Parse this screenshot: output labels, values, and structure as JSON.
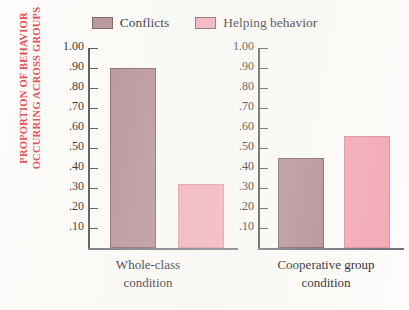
{
  "legend": {
    "entries": [
      {
        "label": "Conflicts",
        "color": "#b08a94",
        "icon": "legend-swatch-icon"
      },
      {
        "label": "Helping behavior",
        "color": "#f2a8b5",
        "icon": "legend-swatch-icon"
      }
    ]
  },
  "axis_title": {
    "line1": "PROPORTION OF BEHAVIOR",
    "line2": "OCCURRING ACROSS GROUPS",
    "color": "#e0474f"
  },
  "panels": [
    {
      "category_line1": "Whole-class",
      "category_line2": "condition",
      "ticks": [
        "1.00",
        ".90",
        ".80",
        ".70",
        ".60",
        ".50",
        ".40",
        ".30",
        ".20",
        ".10"
      ]
    },
    {
      "category_line1": "Cooperative group",
      "category_line2": "condition",
      "ticks": [
        "1.00",
        ".90",
        ".80",
        ".70",
        ".60",
        ".50",
        ".40",
        ".30",
        ".20",
        ".10"
      ]
    }
  ],
  "chart_data": {
    "type": "bar",
    "title": "",
    "xlabel": "",
    "ylabel": "PROPORTION OF BEHAVIOR OCCURRING ACROSS GROUPS",
    "categories": [
      "Whole-class condition",
      "Cooperative group condition"
    ],
    "series": [
      {
        "name": "Conflicts",
        "color": "#b08a94",
        "values": [
          0.9,
          0.45
        ]
      },
      {
        "name": "Helping behavior",
        "color": "#f2a8b5",
        "values": [
          0.32,
          0.56
        ]
      }
    ],
    "ylim": [
      0,
      1.0
    ],
    "ytick_values": [
      1.0,
      0.9,
      0.8,
      0.7,
      0.6,
      0.5,
      0.4,
      0.3,
      0.2,
      0.1
    ],
    "ytick_labels": [
      "1.00",
      ".90",
      ".80",
      ".70",
      ".60",
      ".50",
      ".40",
      ".30",
      ".20",
      ".10"
    ],
    "grid": false,
    "legend_position": "top-center",
    "panels": "separate y-axis per condition"
  }
}
